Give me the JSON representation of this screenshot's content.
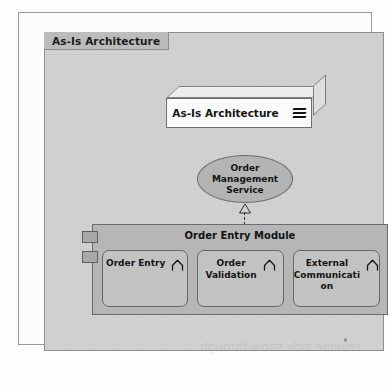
{
  "diagram": {
    "title_tab": "As-Is Architecture",
    "type": "uml-architecture-diagram",
    "node": {
      "label": "As-Is Architecture",
      "icon": "stacked-layers-icon",
      "shape": "3d-box"
    },
    "service": {
      "lines": [
        "Order",
        "Management",
        "Service"
      ],
      "shape": "ellipse"
    },
    "connector": {
      "kind": "realization",
      "style": "dashed",
      "arrowhead": "hollow-triangle"
    },
    "module": {
      "title": "Order Entry Module",
      "shape": "component",
      "tabs": 2,
      "components": [
        {
          "lines": [
            "Order Entry"
          ],
          "icon": "arch-icon"
        },
        {
          "lines": [
            "Order",
            "Validation"
          ],
          "icon": "arch-icon"
        },
        {
          "lines": [
            "External",
            "Communicati",
            "on"
          ],
          "icon": "arch-icon"
        }
      ]
    },
    "artifact": {
      "bleed_text": "reverse side show-through"
    },
    "colors": {
      "canvas": "#d2d2d2",
      "title_tab": "#bcbcbc",
      "module": "#b6b6b6",
      "component": "#c2c2c2",
      "ellipse": "#b4b4b4",
      "node_face": "#fbfbfb",
      "stroke": "#6b6b6b"
    }
  }
}
